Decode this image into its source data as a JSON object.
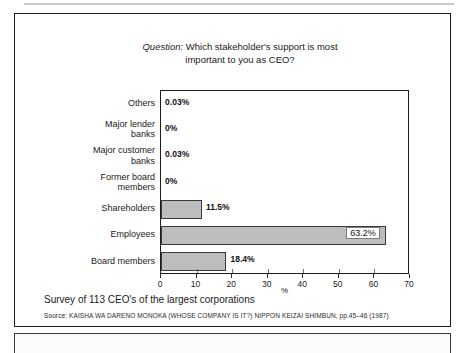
{
  "figure": {
    "title_prefix": "Question:",
    "title_rest": " Which stakeholder's support is most",
    "title_line2": "important to you as CEO?",
    "caption": "Survey of 113 CEO's of the largest corporations",
    "source": "Source: KAISHA WA DARENO MONOKA (WHOSE COMPANY IS IT?) NIPPON KEIZAI SHIMBUN,  pp.45–46 (1987)"
  },
  "chart_data": {
    "type": "bar",
    "orientation": "horizontal",
    "title": "Question: Which stakeholder's support is most important to you as CEO?",
    "xlabel": "%",
    "ylabel": "",
    "xlim": [
      0,
      70
    ],
    "xticks": [
      0,
      10,
      20,
      30,
      40,
      50,
      60,
      70
    ],
    "xtick_labels": [
      "0",
      "10",
      "20",
      "30",
      "40",
      "50",
      "60",
      "70"
    ],
    "grid": false,
    "legend": "none",
    "bar_color": "#bdbdbd",
    "bar_edge_color": "#3a3a3a",
    "categories": [
      "Others",
      "Major lender banks",
      "Major customer banks",
      "Former board members",
      "Shareholders",
      "Employees",
      "Board members"
    ],
    "category_lines": [
      [
        "Others"
      ],
      [
        "Major lender",
        "banks"
      ],
      [
        "Major customer",
        "banks"
      ],
      [
        "Former board",
        "members"
      ],
      [
        "Shareholders"
      ],
      [
        "Employees"
      ],
      [
        "Board members"
      ]
    ],
    "values": [
      0.03,
      0,
      0.03,
      0,
      11.5,
      63.2,
      18.4
    ],
    "value_labels": [
      "0.03%",
      "0%",
      "0.03%",
      "0%",
      "11.5%",
      "63.2%",
      "18.4%"
    ],
    "label_placement": [
      "outside",
      "outside",
      "outside",
      "outside",
      "outside",
      "inside",
      "outside"
    ]
  }
}
